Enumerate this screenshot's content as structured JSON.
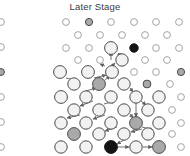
{
  "title": "Later Stage",
  "canvas": {
    "width": 190,
    "height": 156,
    "background": "#ffffff"
  },
  "legend_colors": {
    "unvisited_stroke": "#9a9a9a",
    "unvisited_fill": "#ffffff",
    "visited_stroke": "#4a4a4a",
    "visited_fill": "#f2f2f2",
    "gray_fill": "#a9a9a9",
    "black_fill": "#141414",
    "edge_color": "#6e6e6e"
  },
  "chart_data": {
    "type": "scatter",
    "title": "Later Stage",
    "xlabel": "",
    "ylabel": "",
    "xlim": [
      0,
      190
    ],
    "ylim": [
      0,
      156
    ],
    "grid": false,
    "node_states": [
      "small-open",
      "large-open",
      "gray",
      "black"
    ],
    "series": [
      {
        "name": "nodes",
        "points": [
          {
            "x": 1,
            "y": 22,
            "r": 3.4,
            "state": "small-open"
          },
          {
            "x": 1,
            "y": 47,
            "r": 3.4,
            "state": "small-open"
          },
          {
            "x": 1,
            "y": 72,
            "r": 3.4,
            "state": "gray"
          },
          {
            "x": 1,
            "y": 97,
            "r": 3.4,
            "state": "small-open"
          },
          {
            "x": 1,
            "y": 122,
            "r": 3.4,
            "state": "small-open"
          },
          {
            "x": 1,
            "y": 147,
            "r": 3.4,
            "state": "small-open"
          },
          {
            "x": 66,
            "y": 22,
            "r": 3.4,
            "state": "small-open"
          },
          {
            "x": 89,
            "y": 22,
            "r": 3.6,
            "state": "gray"
          },
          {
            "x": 111,
            "y": 22,
            "r": 3.4,
            "state": "small-open"
          },
          {
            "x": 134,
            "y": 22,
            "r": 3.4,
            "state": "small-open"
          },
          {
            "x": 156,
            "y": 22,
            "r": 3.4,
            "state": "small-open"
          },
          {
            "x": 179,
            "y": 22,
            "r": 3.4,
            "state": "small-open"
          },
          {
            "x": 78,
            "y": 35,
            "r": 3.4,
            "state": "small-open"
          },
          {
            "x": 100,
            "y": 35,
            "r": 3.4,
            "state": "small-open"
          },
          {
            "x": 122,
            "y": 35,
            "r": 3.4,
            "state": "small-open"
          },
          {
            "x": 145,
            "y": 35,
            "r": 3.4,
            "state": "small-open"
          },
          {
            "x": 167,
            "y": 35,
            "r": 3.4,
            "state": "small-open"
          },
          {
            "x": 66,
            "y": 48,
            "r": 3.4,
            "state": "small-open"
          },
          {
            "x": 89,
            "y": 48,
            "r": 3.4,
            "state": "small-open"
          },
          {
            "x": 111,
            "y": 48,
            "r": 6.4,
            "state": "large-open"
          },
          {
            "x": 134,
            "y": 48,
            "r": 4.2,
            "state": "black"
          },
          {
            "x": 156,
            "y": 48,
            "r": 3.4,
            "state": "small-open"
          },
          {
            "x": 179,
            "y": 48,
            "r": 3.4,
            "state": "small-open"
          },
          {
            "x": 78,
            "y": 60,
            "r": 3.4,
            "state": "small-open"
          },
          {
            "x": 100,
            "y": 60,
            "r": 3.4,
            "state": "small-open"
          },
          {
            "x": 122,
            "y": 60,
            "r": 6.2,
            "state": "large-open"
          },
          {
            "x": 145,
            "y": 60,
            "r": 3.4,
            "state": "small-open"
          },
          {
            "x": 167,
            "y": 60,
            "r": 3.4,
            "state": "small-open"
          },
          {
            "x": 60,
            "y": 72,
            "r": 6.4,
            "state": "large-open"
          },
          {
            "x": 88,
            "y": 72,
            "r": 6.4,
            "state": "large-open"
          },
          {
            "x": 112,
            "y": 72,
            "r": 6.4,
            "state": "large-open"
          },
          {
            "x": 134,
            "y": 72,
            "r": 3.4,
            "state": "small-open"
          },
          {
            "x": 156,
            "y": 72,
            "r": 3.4,
            "state": "small-open"
          },
          {
            "x": 181,
            "y": 72,
            "r": 3.6,
            "state": "gray"
          },
          {
            "x": 74,
            "y": 84,
            "r": 6.2,
            "state": "large-open"
          },
          {
            "x": 99,
            "y": 84,
            "r": 6.4,
            "state": "gray"
          },
          {
            "x": 124,
            "y": 84,
            "r": 6.2,
            "state": "large-open"
          },
          {
            "x": 147,
            "y": 84,
            "r": 3.9,
            "state": "gray"
          },
          {
            "x": 170,
            "y": 84,
            "r": 3.4,
            "state": "small-open"
          },
          {
            "x": 61,
            "y": 97,
            "r": 6.4,
            "state": "large-open"
          },
          {
            "x": 86,
            "y": 97,
            "r": 6.2,
            "state": "large-open"
          },
          {
            "x": 111,
            "y": 97,
            "r": 6.2,
            "state": "large-open"
          },
          {
            "x": 136,
            "y": 97,
            "r": 6.2,
            "state": "large-open"
          },
          {
            "x": 159,
            "y": 97,
            "r": 6.2,
            "state": "large-open"
          },
          {
            "x": 181,
            "y": 97,
            "r": 3.4,
            "state": "small-open"
          },
          {
            "x": 74,
            "y": 110,
            "r": 6.2,
            "state": "large-open"
          },
          {
            "x": 99,
            "y": 110,
            "r": 6.2,
            "state": "large-open"
          },
          {
            "x": 124,
            "y": 110,
            "r": 6.2,
            "state": "large-open"
          },
          {
            "x": 148,
            "y": 110,
            "r": 6.2,
            "state": "large-open"
          },
          {
            "x": 172,
            "y": 110,
            "r": 3.4,
            "state": "small-open"
          },
          {
            "x": 61,
            "y": 123,
            "r": 6.2,
            "state": "large-open"
          },
          {
            "x": 86,
            "y": 123,
            "r": 6.2,
            "state": "large-open"
          },
          {
            "x": 111,
            "y": 123,
            "r": 6.2,
            "state": "large-open"
          },
          {
            "x": 136,
            "y": 123,
            "r": 6.4,
            "state": "gray"
          },
          {
            "x": 159,
            "y": 123,
            "r": 6.2,
            "state": "large-open"
          },
          {
            "x": 181,
            "y": 123,
            "r": 3.4,
            "state": "small-open"
          },
          {
            "x": 74,
            "y": 134,
            "r": 6.4,
            "state": "gray"
          },
          {
            "x": 99,
            "y": 134,
            "r": 6.2,
            "state": "large-open"
          },
          {
            "x": 124,
            "y": 134,
            "r": 6.2,
            "state": "large-open"
          },
          {
            "x": 148,
            "y": 134,
            "r": 6.2,
            "state": "large-open"
          },
          {
            "x": 172,
            "y": 134,
            "r": 3.4,
            "state": "small-open"
          },
          {
            "x": 61,
            "y": 147,
            "r": 6.2,
            "state": "large-open"
          },
          {
            "x": 86,
            "y": 147,
            "r": 6.2,
            "state": "large-open"
          },
          {
            "x": 111,
            "y": 147,
            "r": 6.4,
            "state": "black"
          },
          {
            "x": 136,
            "y": 147,
            "r": 6.2,
            "state": "large-open"
          },
          {
            "x": 159,
            "y": 147,
            "r": 6.4,
            "state": "gray"
          },
          {
            "x": 181,
            "y": 147,
            "r": 3.4,
            "state": "small-open"
          }
        ]
      },
      {
        "name": "edges",
        "arrows": [
          {
            "x1": 111,
            "y1": 60,
            "x2": 111,
            "y2": 52
          },
          {
            "x1": 117,
            "y1": 55,
            "x2": 122,
            "y2": 54
          },
          {
            "x1": 112,
            "y1": 66,
            "x2": 115,
            "y2": 63
          },
          {
            "x1": 105,
            "y1": 66,
            "x2": 100,
            "y2": 64
          },
          {
            "x1": 94,
            "y1": 78,
            "x2": 106,
            "y2": 75
          },
          {
            "x1": 66,
            "y1": 78,
            "x2": 79,
            "y2": 81
          },
          {
            "x1": 105,
            "y1": 80,
            "x2": 110,
            "y2": 76
          },
          {
            "x1": 118,
            "y1": 80,
            "x2": 128,
            "y2": 82
          },
          {
            "x1": 86,
            "y1": 91,
            "x2": 96,
            "y2": 88
          },
          {
            "x1": 86,
            "y1": 91,
            "x2": 86,
            "y2": 103
          },
          {
            "x1": 130,
            "y1": 88,
            "x2": 133,
            "y2": 92
          },
          {
            "x1": 93,
            "y1": 101,
            "x2": 80,
            "y2": 106
          },
          {
            "x1": 104,
            "y1": 104,
            "x2": 115,
            "y2": 101
          },
          {
            "x1": 99,
            "y1": 104,
            "x2": 99,
            "y2": 116
          },
          {
            "x1": 141,
            "y1": 101,
            "x2": 146,
            "y2": 105
          },
          {
            "x1": 136,
            "y1": 103,
            "x2": 136,
            "y2": 117
          },
          {
            "x1": 80,
            "y1": 115,
            "x2": 67,
            "y2": 118
          },
          {
            "x1": 130,
            "y1": 114,
            "x2": 133,
            "y2": 118
          },
          {
            "x1": 105,
            "y1": 115,
            "x2": 93,
            "y2": 119
          },
          {
            "x1": 117,
            "y1": 127,
            "x2": 105,
            "y2": 131
          },
          {
            "x1": 142,
            "y1": 127,
            "x2": 153,
            "y2": 130
          },
          {
            "x1": 142,
            "y1": 129,
            "x2": 131,
            "y2": 132
          },
          {
            "x1": 124,
            "y1": 140,
            "x2": 117,
            "y2": 144
          },
          {
            "x1": 118,
            "y1": 147,
            "x2": 129,
            "y2": 147
          },
          {
            "x1": 143,
            "y1": 147,
            "x2": 152,
            "y2": 147
          }
        ]
      }
    ]
  }
}
